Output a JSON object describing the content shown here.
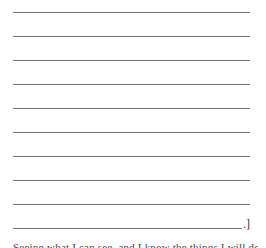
{
  "form": {
    "lines": [
      {
        "top": 12,
        "width": 237
      },
      {
        "top": 36,
        "width": 237
      },
      {
        "top": 60,
        "width": 237
      },
      {
        "top": 84,
        "width": 237
      },
      {
        "top": 108,
        "width": 237
      },
      {
        "top": 132,
        "width": 237
      },
      {
        "top": 156,
        "width": 237
      },
      {
        "top": 180,
        "width": 237
      },
      {
        "top": 204,
        "width": 237
      },
      {
        "top": 228,
        "width": 229
      }
    ],
    "end_mark": ".]",
    "line_color": "#6f6f6f"
  },
  "caption": {
    "text": "Seeing what I can see, and I know the things I will do"
  }
}
